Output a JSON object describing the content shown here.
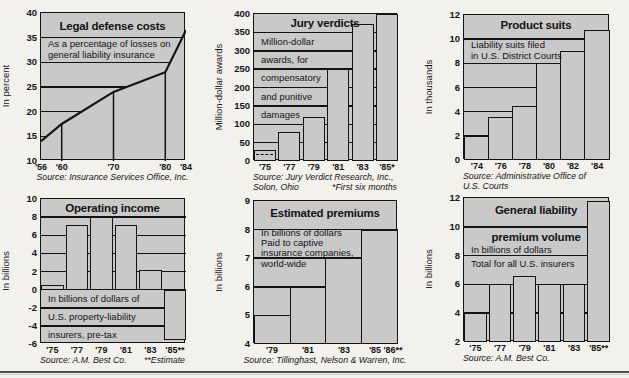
{
  "page": {
    "background": "#f3f1ec",
    "plot_background": "#c9c9c9",
    "ink_color": "#141414",
    "footer_rule_color": "#4f4f4f"
  },
  "chart_data": [
    {
      "id": "legal-defense-costs",
      "type": "line",
      "title_lines": [
        {
          "text": "Legal defense costs",
          "v": 37.2
        }
      ],
      "subtitle_lines": [
        {
          "text": "As a percentage of losses on",
          "v": 33.7
        },
        {
          "text": "general liability  insurance",
          "v": 31.5
        }
      ],
      "ylabel": "In percent",
      "ylim": [
        10,
        40
      ],
      "yticks": [
        40,
        35,
        30,
        25,
        20,
        15,
        10
      ],
      "xlim": [
        56,
        84
      ],
      "x": [
        56,
        60,
        70,
        80,
        84
      ],
      "values": [
        14,
        17.5,
        24,
        28,
        36.5
      ],
      "droplines": [
        60,
        70,
        80
      ],
      "xlabels": [
        {
          "text": "'56",
          "f": 0.0
        },
        {
          "text": "'60",
          "f": 0.143
        },
        {
          "text": "'70",
          "f": 0.5
        },
        {
          "text": "'80",
          "f": 0.857
        },
        {
          "text": "'84",
          "f": 1.0
        }
      ],
      "source_rows": [
        {
          "center": "Source: Insurance Services Office, Inc."
        }
      ]
    },
    {
      "id": "jury-verdicts",
      "type": "bar",
      "title_lines": [
        {
          "text": "Jury verdicts",
          "v": 372
        }
      ],
      "subtitle_lines": [
        {
          "text": "Million-dollar",
          "v": 325
        },
        {
          "text": "awards, for",
          "v": 275
        },
        {
          "text": "compensatory",
          "v": 225
        },
        {
          "text": "and punitive",
          "v": 175
        },
        {
          "text": "damages",
          "v": 125
        }
      ],
      "ylabel": "Million-dollar awards",
      "ylim": [
        0,
        400
      ],
      "yticks": [
        400,
        350,
        300,
        250,
        200,
        150,
        100,
        50,
        0
      ],
      "categories": [
        "'75",
        "'77",
        "'79",
        "'81",
        "'83",
        "'85*"
      ],
      "values": [
        30,
        78,
        120,
        250,
        372,
        400
      ],
      "baseline": 0,
      "bar_gap": 2.5,
      "dashed_marker": {
        "bar_index": 0,
        "value": 20
      },
      "xlabels": [
        {
          "text": "'75",
          "f": 0.076
        },
        {
          "text": "'77",
          "f": 0.246
        },
        {
          "text": "'79",
          "f": 0.415
        },
        {
          "text": "'81",
          "f": 0.585
        },
        {
          "text": "'83",
          "f": 0.754
        },
        {
          "text": "'85*",
          "f": 0.924
        }
      ],
      "source_rows": [
        {
          "left": "Source: Jury Verdict Research, Inc.,"
        },
        {
          "left": "Solon, Ohio",
          "right": "*First six months"
        }
      ]
    },
    {
      "id": "product-suits",
      "type": "bar",
      "title_lines": [
        {
          "text": "Product suits",
          "v": 11.1
        }
      ],
      "subtitle_lines": [
        {
          "text": "Liability suits filed",
          "v": 9.5
        },
        {
          "text": "in U.S. District Courts",
          "v": 8.6
        }
      ],
      "ylabel": "In thousands",
      "ylim": [
        0,
        12
      ],
      "yticks": [
        12,
        10,
        8,
        6,
        4,
        2,
        0
      ],
      "categories": [
        "'74",
        "'76",
        "'78",
        "'80",
        "'82",
        "'84"
      ],
      "values": [
        2,
        3.6,
        4.5,
        8,
        9,
        10.8
      ],
      "baseline": 0,
      "bar_gap": -1.5,
      "xlabels": [
        {
          "text": "'74",
          "f": 0.088
        },
        {
          "text": "'76",
          "f": 0.252
        },
        {
          "text": "'78",
          "f": 0.417
        },
        {
          "text": "'80",
          "f": 0.582
        },
        {
          "text": "'82",
          "f": 0.747
        },
        {
          "text": "'84",
          "f": 0.912
        }
      ],
      "source_rows": [
        {
          "left": "Source: Administrative Office of"
        },
        {
          "left": "U.S. Courts"
        }
      ]
    },
    {
      "id": "operating-income",
      "type": "bar",
      "title_lines": [
        {
          "text": "Operating income",
          "v": 8.95
        }
      ],
      "subtitle_lines": [
        {
          "text": "In billions of dollars of",
          "v": -1.0
        },
        {
          "text": "U.S. property-liability",
          "v": -3.0
        },
        {
          "text": "insurers, pre-tax",
          "v": -5.0
        }
      ],
      "ylabel": "In billions",
      "ylim": [
        -6,
        10
      ],
      "yticks": [
        10,
        8,
        6,
        4,
        2,
        0,
        -2,
        -4,
        -6
      ],
      "categories": [
        "'75",
        "'77",
        "'79",
        "'81",
        "'83",
        "'85**"
      ],
      "values": [
        0.5,
        7.1,
        8,
        7.1,
        2.2,
        -5.6
      ],
      "baseline": 0,
      "bar_gap": 2,
      "xlabels": [
        {
          "text": "'75",
          "f": 0.078
        },
        {
          "text": "'77",
          "f": 0.247
        },
        {
          "text": "'79",
          "f": 0.416
        },
        {
          "text": "'81",
          "f": 0.585
        },
        {
          "text": "'83",
          "f": 0.754
        },
        {
          "text": "'85**",
          "f": 0.923
        }
      ],
      "source_rows": [
        {
          "left": "Source: A.M. Best Co.",
          "right": "**Estimate"
        }
      ]
    },
    {
      "id": "estimated-premiums",
      "type": "bar",
      "title_lines": [
        {
          "text": "Estimated premiums",
          "v": 8.55
        }
      ],
      "subtitle_lines": [
        {
          "text": "In billions of dollars",
          "v": 7.88
        },
        {
          "text": "Paid to captive",
          "v": 7.53
        },
        {
          "text": "insurance companies,",
          "v": 7.18
        },
        {
          "text": "world-wide",
          "v": 6.8
        }
      ],
      "ylabel": "In billions",
      "ylim": [
        4,
        9
      ],
      "yticks": [
        9,
        8,
        7,
        6,
        5,
        4
      ],
      "categories": [
        "'79",
        "'81",
        "'83",
        "'85"
      ],
      "values": [
        5,
        6,
        7,
        8
      ],
      "baseline": 4,
      "bar_gap": -1.5,
      "xlabels": [
        {
          "text": "'79",
          "f": 0.125
        },
        {
          "text": "'81",
          "f": 0.375
        },
        {
          "text": "'83",
          "f": 0.625
        },
        {
          "text": "'85",
          "f": 0.84
        },
        {
          "text": "'86**",
          "f": 0.965
        }
      ],
      "source_rows": [
        {
          "center": "Source: Tillinghast, Nelson & Warren, Inc."
        }
      ]
    },
    {
      "id": "general-liability-premium-volume",
      "type": "bar",
      "title_lines": [
        {
          "text": "General liability",
          "v": 11.1
        },
        {
          "text": "premium volume",
          "v": 9.2
        }
      ],
      "subtitle_lines": [
        {
          "text": "In billions of dollars",
          "v": 8.4
        },
        {
          "text": "Total for all U.S. insurers",
          "v": 7.4
        }
      ],
      "ylabel": "In billions",
      "ylim": [
        2,
        12
      ],
      "yticks": [
        12,
        10,
        8,
        6,
        4,
        2
      ],
      "categories": [
        "'75",
        "'77",
        "'79",
        "'81",
        "'83",
        "'85**"
      ],
      "values": [
        4,
        6,
        6.6,
        6,
        6,
        11.8
      ],
      "baseline": 2,
      "bar_gap": 2,
      "xlabels": [
        {
          "text": "'75",
          "f": 0.078
        },
        {
          "text": "'77",
          "f": 0.247
        },
        {
          "text": "'79",
          "f": 0.416
        },
        {
          "text": "'81",
          "f": 0.585
        },
        {
          "text": "'83",
          "f": 0.754
        },
        {
          "text": "'85**",
          "f": 0.923
        }
      ],
      "source_rows": [
        {
          "left": "Source: A.M. Best Co."
        }
      ]
    }
  ]
}
